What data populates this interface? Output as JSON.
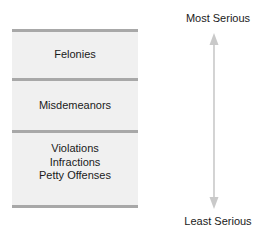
{
  "diagram": {
    "tiers": [
      {
        "id": "felonies",
        "lines": [
          "Felonies"
        ]
      },
      {
        "id": "misdemeanors",
        "lines": [
          "Misdemeanors"
        ]
      },
      {
        "id": "violations",
        "lines": [
          "Violations",
          "Infractions",
          "Petty Offenses"
        ]
      }
    ],
    "axis": {
      "top_label": "Most Serious",
      "bottom_label": "Least Serious",
      "arrow": "double-headed-vertical-arrow"
    },
    "colors": {
      "tier_fill": "#f0f0f0",
      "rule": "#a8a8a8",
      "arrow": "#c9c9c9",
      "text": "#1a1a1a",
      "background": "#ffffff"
    }
  }
}
